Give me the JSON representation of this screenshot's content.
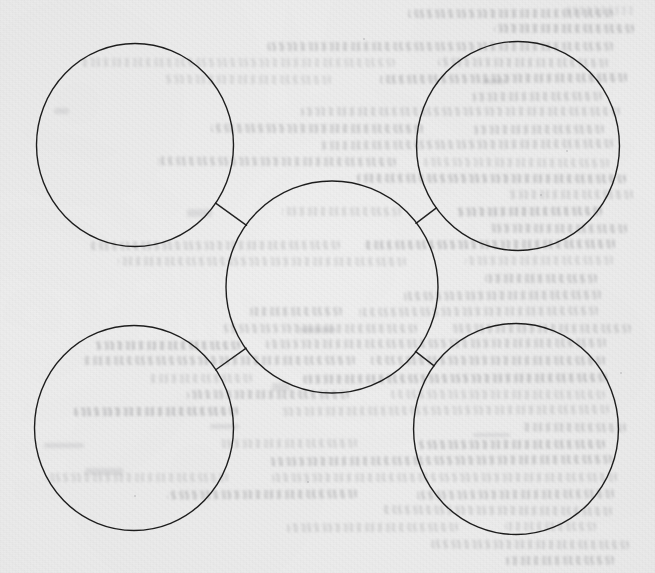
{
  "document": {
    "medium": "scanned-paper",
    "title": "Hand-drawn concept map",
    "paper_color": "#ebebeb",
    "ink_color": "#1f1f1f",
    "page_width": 655,
    "page_height": 573,
    "visible_text": "",
    "notes": "No legible text is printed on this side of the page; the only text-like marks are faint mirrored bleed-through from the reverse side and are illegible."
  },
  "chart_data": {
    "type": "diagram",
    "diagram_kind": "hub-and-spoke concept map",
    "title": "",
    "node_count": 5,
    "edge_count": 4,
    "nodes": [
      {
        "id": "center",
        "label": "",
        "role": "hub",
        "cx": 332,
        "cy": 287,
        "r": 106
      },
      {
        "id": "top-left",
        "label": "",
        "role": "satellite",
        "cx": 135,
        "cy": 145,
        "r": 100
      },
      {
        "id": "top-right",
        "label": "",
        "role": "satellite",
        "cx": 518,
        "cy": 146,
        "r": 103
      },
      {
        "id": "bottom-left",
        "label": "",
        "role": "satellite",
        "cx": 134,
        "cy": 428,
        "r": 101
      },
      {
        "id": "bottom-right",
        "label": "",
        "role": "satellite",
        "cx": 516,
        "cy": 429,
        "r": 104
      }
    ],
    "edges": [
      {
        "from": "top-left",
        "to": "center",
        "style": "straight-line"
      },
      {
        "from": "top-right",
        "to": "center",
        "style": "straight-line"
      },
      {
        "from": "bottom-left",
        "to": "center",
        "style": "straight-line"
      },
      {
        "from": "bottom-right",
        "to": "center",
        "style": "straight-line"
      }
    ],
    "node_fill": "none",
    "stroke_width": 1.4,
    "all_nodes_empty": true
  },
  "annotations": {
    "corner_stamp_text": "",
    "bleed_through_legible": false
  }
}
